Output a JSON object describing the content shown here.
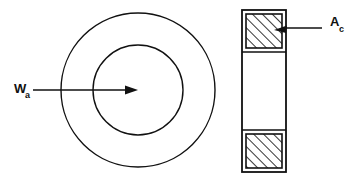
{
  "figure": {
    "type": "engineering-diagram",
    "background_color": "#ffffff",
    "line_color": "#111111"
  },
  "labels": {
    "width_label": {
      "symbol": "W",
      "subscript": "a",
      "full": "Wa",
      "points_to": "front-view-center",
      "x": 14,
      "y": 93
    },
    "area_label": {
      "symbol": "A",
      "subscript": "c",
      "full": "Ac",
      "points_to": "top-hatched-cross-section",
      "x": 330,
      "y": 26
    }
  },
  "front_view": {
    "name": "concentric-circles",
    "center_x": 138,
    "center_y": 90,
    "outer_radius": 77,
    "inner_radius": 45,
    "stroke_width": 1.4
  },
  "side_view": {
    "name": "cross-section-rectangle",
    "outer": {
      "x": 242,
      "y": 10,
      "width": 44,
      "height": 162
    },
    "stroke_width": 1.6,
    "top_block": {
      "x": 246,
      "y": 14,
      "width": 36,
      "height": 34,
      "hatched": true
    },
    "bottom_block": {
      "x": 246,
      "y": 134,
      "width": 36,
      "height": 34,
      "hatched": true
    },
    "middle_open": {
      "x": 246,
      "y": 52,
      "width": 36,
      "height": 78,
      "hatched": false
    },
    "hatch_direction": "lower-left-to-upper-right",
    "hatch_spacing": 7
  },
  "leaders": {
    "width_arrow": {
      "name": "wa-leader-arrow",
      "x1": 33,
      "y1": 90,
      "x2": 134,
      "y2": 90,
      "arrowhead": "right-solid-triangle"
    },
    "area_leader": {
      "name": "ac-leader-arrow",
      "x1": 322,
      "y1": 28,
      "x2": 278,
      "y2": 28,
      "arrowhead": "left-solid-triangle"
    }
  }
}
